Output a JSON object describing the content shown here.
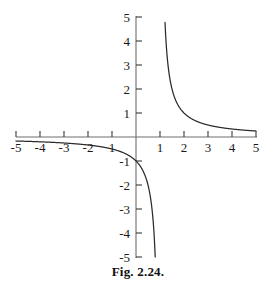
{
  "figure": {
    "caption": "Fig. 2.24.",
    "background_color": "#ffffff",
    "axis_color": "#6e6e6e",
    "curve_color": "#2b2b2b",
    "label_color": "#1a1a1a"
  },
  "chart_data": {
    "type": "line",
    "title": "",
    "subtitle": "",
    "xlabel": "",
    "ylabel": "",
    "function": "y = 1/(x - 1)",
    "xlim": [
      -5,
      5
    ],
    "ylim": [
      -5,
      5
    ],
    "grid": false,
    "legend": "none",
    "axes": {
      "origin": [
        0,
        0
      ],
      "x_ticks": [
        -5,
        -4,
        -3,
        -2,
        -1,
        1,
        2,
        3,
        4,
        5
      ],
      "y_ticks": [
        5,
        4,
        3,
        2,
        1,
        -1,
        -2,
        -3,
        -4,
        -5
      ],
      "x_tick_labels": [
        "-5",
        "-4",
        "-3",
        "-2",
        "1",
        "1",
        "2",
        "3",
        "4",
        "5"
      ],
      "y_tick_labels": [
        "5",
        "4",
        "3",
        "2",
        "1",
        "-1",
        "-2",
        "-3",
        "-4",
        "-5"
      ],
      "x_tick_direction": "up",
      "y_tick_direction": "right",
      "x_label_side": "below",
      "y_label_side": "left"
    },
    "asymptotes": {
      "vertical": [
        1
      ],
      "horizontal": [
        0
      ]
    },
    "series": [
      {
        "name": "left-branch",
        "x": [
          -5.0,
          -4.5,
          -4.0,
          -3.5,
          -3.0,
          -2.5,
          -2.0,
          -1.5,
          -1.0,
          -0.5,
          0.0,
          0.2,
          0.4,
          0.5,
          0.6,
          0.7,
          0.75,
          0.8
        ],
        "y": [
          -0.167,
          -0.182,
          -0.2,
          -0.222,
          -0.25,
          -0.286,
          -0.333,
          -0.4,
          -0.5,
          -0.667,
          -1.0,
          -1.25,
          -1.667,
          -2.0,
          -2.5,
          -3.333,
          -4.0,
          -5.0
        ]
      },
      {
        "name": "right-branch",
        "x": [
          1.2,
          1.25,
          1.3,
          1.4,
          1.5,
          1.6,
          1.8,
          2.0,
          2.25,
          2.5,
          3.0,
          3.5,
          4.0,
          4.5,
          5.0
        ],
        "y": [
          5.0,
          4.0,
          3.333,
          2.5,
          2.0,
          1.667,
          1.25,
          1.0,
          0.8,
          0.667,
          0.5,
          0.4,
          0.333,
          0.286,
          0.25
        ]
      }
    ],
    "annotations": []
  },
  "x_tick_labels": [
    {
      "text": "-5",
      "value": -5
    },
    {
      "text": "-4",
      "value": -4
    },
    {
      "text": "-3",
      "value": -3
    },
    {
      "text": "-2",
      "value": -2
    },
    {
      "text": "1",
      "value": -1
    },
    {
      "text": "1",
      "value": 1
    },
    {
      "text": "2",
      "value": 2
    },
    {
      "text": "3",
      "value": 3
    },
    {
      "text": "4",
      "value": 4
    },
    {
      "text": "5",
      "value": 5
    }
  ],
  "y_tick_labels": [
    {
      "text": "5",
      "value": 5
    },
    {
      "text": "4",
      "value": 4
    },
    {
      "text": "3",
      "value": 3
    },
    {
      "text": "2",
      "value": 2
    },
    {
      "text": "1",
      "value": 1
    },
    {
      "text": "-1",
      "value": -1
    },
    {
      "text": "-2",
      "value": -2
    },
    {
      "text": "-3",
      "value": -3
    },
    {
      "text": "-4",
      "value": -4
    },
    {
      "text": "-5",
      "value": -5
    }
  ]
}
